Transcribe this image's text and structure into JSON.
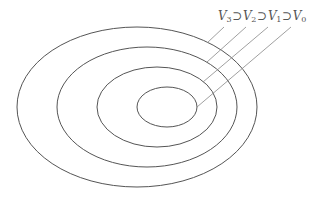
{
  "diagram": {
    "type": "nested-ellipses",
    "label": {
      "sets": [
        {
          "symbol": "V",
          "subscript": "3"
        },
        {
          "symbol": "V",
          "subscript": "2"
        },
        {
          "symbol": "V",
          "subscript": "1"
        },
        {
          "symbol": "V",
          "subscript": "0"
        }
      ],
      "relation": "⊃",
      "full_text": "V3 ⊃ V2 ⊃ V1 ⊃ V0"
    },
    "ellipses": [
      {
        "name": "V3",
        "cx": 137,
        "cy": 107,
        "rx": 120,
        "ry": 80
      },
      {
        "name": "V2",
        "cx": 147,
        "cy": 107,
        "rx": 90,
        "ry": 60
      },
      {
        "name": "V1",
        "cx": 157,
        "cy": 107,
        "rx": 60,
        "ry": 40
      },
      {
        "name": "V0",
        "cx": 167,
        "cy": 107,
        "rx": 30,
        "ry": 20
      }
    ],
    "stroke_color": "#555555",
    "leader_color": "#888888"
  }
}
